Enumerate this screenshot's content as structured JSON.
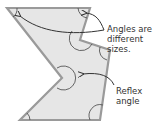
{
  "diagram": {
    "type": "irregular-polygon-angles",
    "labels": {
      "top": [
        "Angles are",
        "different sizes."
      ],
      "bottom": [
        "Reflex",
        "angle"
      ]
    },
    "colors": {
      "fill": "#e6e6e6",
      "stroke": "#9a9a9a",
      "arc": "#555555",
      "arrow": "#333333",
      "text": "#333333"
    }
  }
}
